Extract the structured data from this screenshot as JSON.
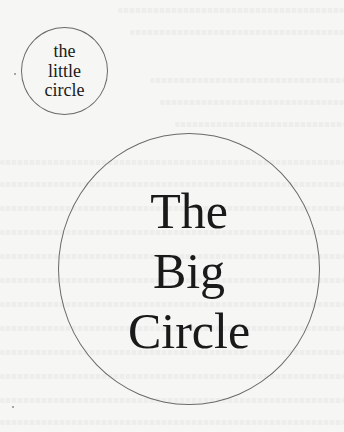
{
  "little_circle": {
    "lines": [
      "the",
      "little",
      "circle"
    ]
  },
  "big_circle": {
    "lines": [
      "The",
      "Big",
      "Circle"
    ]
  },
  "colors": {
    "paper": "#f6f6f4",
    "ink": "#1a1a1a",
    "circle_stroke": "#6a6a6a"
  }
}
